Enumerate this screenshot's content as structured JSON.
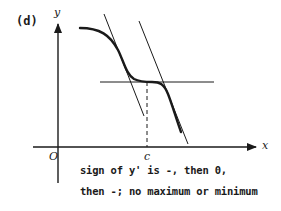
{
  "figure": {
    "panel_label": "(d)",
    "axes": {
      "y_label": "y",
      "x_label": "x",
      "origin_label": "O",
      "critical_point_label": "c"
    },
    "curve": {
      "description": "decreasing curve with horizontal inflection tangent at x = c",
      "tangent_lines": [
        "steep tangent left of c",
        "horizontal tangent at c",
        "steep tangent right of c"
      ],
      "dashed_guide": "vertical dashed line from curve at c down to x-axis"
    },
    "caption": {
      "line1": "sign of y' is -, then 0,",
      "line2": "then -; no maximum or minimum"
    },
    "colors": {
      "ink": "#1a1a1a",
      "background": "#ffffff"
    }
  }
}
